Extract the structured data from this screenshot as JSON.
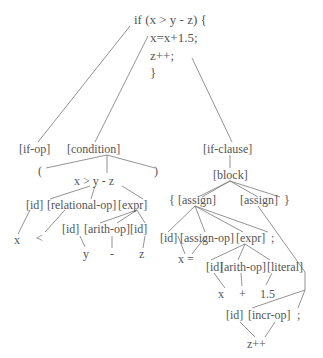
{
  "diagram": {
    "type": "parse-tree",
    "root_code": {
      "line1": "if (x > y - z) {",
      "line2": "x=x+1.5;",
      "line3": "z++;",
      "line4": "}"
    },
    "nodes": {
      "if_op": "[if-op]",
      "condition": "[condition]",
      "lparen": "(",
      "rparen": ")",
      "cond_expr": "x > y - z",
      "id1": "[id]",
      "relational_op": "[relational-op]",
      "expr1": "[expr]",
      "x1": "x",
      "lt": "<",
      "id2": "[id]",
      "arith_op1": "[arith-op]",
      "id3": "[id]",
      "y": "y",
      "minus": "-",
      "z": "z",
      "if_clause": "[if-clause]",
      "block": "[block]",
      "lbrace": "{",
      "assign1": "[assign]",
      "assign2": "[assign]",
      "rbrace": "}",
      "id4": "[id]",
      "assign_op": "[assign-op]",
      "expr2": "[expr]",
      "semi1": ";",
      "x_eq": "x =",
      "id5": "[id]",
      "arith_op2": "[arith-op]",
      "literal": "[literal]",
      "x2": "x",
      "plus": "+",
      "num": "1.5",
      "id6": "[id]",
      "incr_op": "[incr-op]",
      "semi2": ";",
      "zpp": "z++"
    }
  }
}
